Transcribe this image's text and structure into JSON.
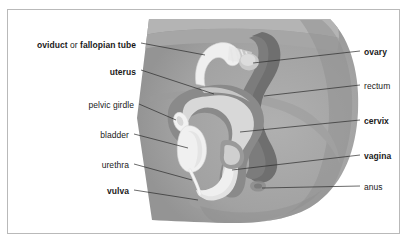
{
  "figure": {
    "title_text": "",
    "frame_color": "#b9b9b9",
    "background_color": "#ffffff",
    "label_color": "#1a1a1a",
    "leader_line_color": "#2b2b2b"
  },
  "palette": {
    "body_outer": "#a8a8a8",
    "body_mid": "#9a9a9a",
    "body_shadow": "#8d8d8d",
    "muscle_dark": "#7e7e7e",
    "rectum": "#6f6f6f",
    "uterus_wall": "#8a8a8a",
    "uterus_cavity": "#d8d8d8",
    "bone_white": "#f2f2f2",
    "tube_white": "#efefef",
    "vagina_canal": "#e2e2e2"
  },
  "labels_left": [
    {
      "id": "oviduct",
      "parts": [
        {
          "text": "oviduct",
          "weight": "bold"
        },
        {
          "text": " or ",
          "weight": "normal"
        },
        {
          "text": "fallopian tube",
          "weight": "bold"
        }
      ]
    },
    {
      "id": "uterus",
      "parts": [
        {
          "text": "uterus",
          "weight": "bold"
        }
      ]
    },
    {
      "id": "pelvic-girdle",
      "parts": [
        {
          "text": "pelvic girdle",
          "weight": "normal"
        }
      ]
    },
    {
      "id": "bladder",
      "parts": [
        {
          "text": "bladder",
          "weight": "normal"
        }
      ]
    },
    {
      "id": "urethra",
      "parts": [
        {
          "text": "urethra",
          "weight": "normal"
        }
      ]
    },
    {
      "id": "vulva",
      "parts": [
        {
          "text": "vulva",
          "weight": "bold"
        }
      ]
    }
  ],
  "labels_right": [
    {
      "id": "ovary",
      "parts": [
        {
          "text": "ovary",
          "weight": "bold"
        }
      ]
    },
    {
      "id": "rectum",
      "parts": [
        {
          "text": "rectum",
          "weight": "normal"
        }
      ]
    },
    {
      "id": "cervix",
      "parts": [
        {
          "text": "cervix",
          "weight": "bold"
        }
      ]
    },
    {
      "id": "vagina",
      "parts": [
        {
          "text": "vagina",
          "weight": "bold"
        }
      ]
    },
    {
      "id": "anus",
      "parts": [
        {
          "text": "anus",
          "weight": "normal"
        }
      ]
    }
  ],
  "left_label_text": {
    "oviduct_a": "oviduct",
    "oviduct_or": " or ",
    "oviduct_b": "fallopian tube",
    "uterus": "uterus",
    "pelvic_girdle": "pelvic girdle",
    "bladder": "bladder",
    "urethra": "urethra",
    "vulva": "vulva"
  },
  "right_label_text": {
    "ovary": "ovary",
    "rectum": "rectum",
    "cervix": "cervix",
    "vagina": "vagina",
    "anus": "anus"
  }
}
